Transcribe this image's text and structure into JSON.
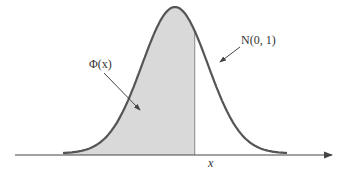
{
  "diagram": {
    "curve_label": "N(0, 1)",
    "area_label": "Φ(x)",
    "x_marker_label": "x",
    "distribution": {
      "mean": 0,
      "std": 1,
      "x_range": [
        -3.4,
        3.4
      ],
      "cutoff_x": 0.6
    },
    "colors": {
      "curve": "#555555",
      "fill": "#d9d9d9",
      "axis": "#444444",
      "cutoff_line": "#888888",
      "text": "#333333"
    }
  }
}
